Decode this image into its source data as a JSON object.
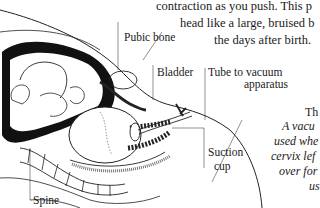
{
  "body_text": {
    "lines": [
      "contraction as you push. This p",
      "head like a large, bruised b",
      "the days after birth."
    ]
  },
  "diagram": {
    "labels": {
      "pubic_bone": "Pubic bone",
      "bladder": "Bladder",
      "tube_line1": "Tube to vacuum",
      "tube_line2": "apparatus",
      "suction_line1": "Suction",
      "suction_line2": "cup",
      "spine": "Spine"
    }
  },
  "caption": {
    "title": "Th",
    "lines": [
      "A vacu",
      "used whe",
      "cervix lef",
      "over for",
      "us"
    ]
  }
}
